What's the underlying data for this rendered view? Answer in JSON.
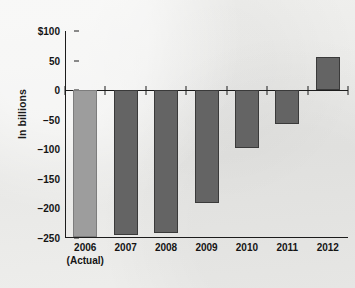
{
  "chart_data": {
    "type": "bar",
    "title": "",
    "xlabel": "",
    "ylabel": "In billions",
    "categories": [
      "2006",
      "2007",
      "2008",
      "2009",
      "2010",
      "2011",
      "2012"
    ],
    "category_sublabels": [
      "(Actual)",
      "",
      "",
      "",
      "",
      "",
      ""
    ],
    "values": [
      -248,
      -245,
      -242,
      -191,
      -97,
      -58,
      56
    ],
    "ylim": [
      -250,
      100
    ],
    "y_ticks": [
      100,
      50,
      0,
      -50,
      -100,
      -150,
      -200,
      -250
    ],
    "y_tick_labels": [
      "$100",
      "50",
      "0",
      "−50",
      "−100",
      "−150",
      "−200",
      "−250"
    ],
    "grid": false,
    "legend": "none",
    "series": [
      {
        "name": "Budget balance",
        "values": [
          -248,
          -245,
          -242,
          -191,
          -97,
          -58,
          56
        ]
      }
    ],
    "bar_colors": [
      "#9d9d9d",
      "#646464",
      "#646464",
      "#646464",
      "#646464",
      "#646464",
      "#646464"
    ],
    "colors": {
      "background": "#ececeb",
      "axis": "#1c1c1c",
      "bar_actual": "#9d9d9d",
      "bar_projected": "#646464",
      "text": "#141414"
    }
  }
}
